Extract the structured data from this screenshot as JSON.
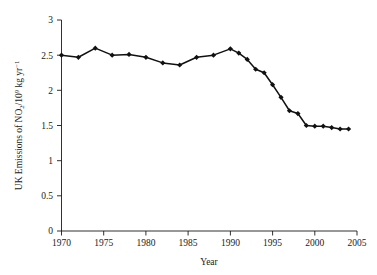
{
  "chart_data": {
    "type": "line",
    "title": "",
    "xlabel": "Year",
    "ylabel": "UK Emissions of NO2/10^9 kg yr^-1",
    "ylabel_parts": {
      "prefix": "UK Emissions of NO",
      "sub": "2",
      "mid": "/10",
      "sup": "9",
      "suffix": " kg yr",
      "sup2": "−1"
    },
    "xlim": [
      1970,
      2005
    ],
    "ylim": [
      0,
      3
    ],
    "xticks": [
      1970,
      1975,
      1980,
      1985,
      1990,
      1995,
      2000,
      2005
    ],
    "xtick_labels": [
      "1970",
      "1975",
      "1980",
      "1985",
      "1990",
      "1995",
      "2000",
      "2005"
    ],
    "yticks": [
      0,
      0.5,
      1,
      1.5,
      2,
      2.5,
      3
    ],
    "ytick_labels": [
      "0",
      "0.5",
      "1",
      "1.5",
      "2",
      "2.5",
      "3"
    ],
    "grid": false,
    "legend": null,
    "marker": "diamond",
    "line_color": "#111111",
    "marker_color": "#111111",
    "x": [
      1970,
      1972,
      1974,
      1976,
      1978,
      1980,
      1982,
      1984,
      1986,
      1988,
      1990,
      1991,
      1992,
      1993,
      1994,
      1995,
      1996,
      1997,
      1998,
      1999,
      2000,
      2001,
      2002,
      2003,
      2004
    ],
    "values": [
      2.5,
      2.47,
      2.6,
      2.5,
      2.51,
      2.47,
      2.39,
      2.36,
      2.47,
      2.5,
      2.59,
      2.53,
      2.44,
      2.3,
      2.25,
      2.08,
      1.9,
      1.71,
      1.67,
      1.5,
      1.49,
      1.49,
      1.47,
      1.45,
      1.45
    ],
    "series": [
      {
        "name": "UK NOx emissions",
        "values": [
          2.5,
          2.47,
          2.6,
          2.5,
          2.51,
          2.47,
          2.39,
          2.36,
          2.47,
          2.5,
          2.59,
          2.53,
          2.44,
          2.3,
          2.25,
          2.08,
          1.9,
          1.71,
          1.67,
          1.5,
          1.49,
          1.49,
          1.47,
          1.45,
          1.45
        ]
      }
    ]
  }
}
